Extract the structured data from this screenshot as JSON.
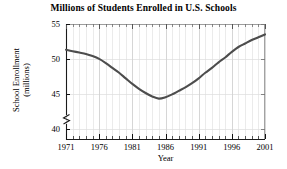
{
  "chart_data": {
    "type": "line",
    "title": "Millions of Students Enrolled in U.S. Schools",
    "xlabel": "Year",
    "ylabel_line1": "School Enrollment",
    "ylabel_line2": "(millions)",
    "xlim": [
      1971,
      2001
    ],
    "ylim": [
      38.5,
      55
    ],
    "axis_break": true,
    "grid": true,
    "legend": "none",
    "x_major_ticks": [
      1971,
      1976,
      1981,
      1986,
      1991,
      1996,
      2001
    ],
    "x_major_tick_labels": [
      "1971",
      "1976",
      "1981",
      "1986",
      "1991",
      "1996",
      "2001"
    ],
    "x_minor_tick_step": 1,
    "y_major_ticks": [
      40,
      45,
      50,
      55
    ],
    "y_major_tick_labels": [
      "40",
      "45",
      "50",
      "55"
    ],
    "series": [
      {
        "name": "School Enrollment",
        "color": "#4d4d4d",
        "x": [
          1971,
          1972,
          1973,
          1974,
          1975,
          1976,
          1977,
          1978,
          1979,
          1980,
          1981,
          1982,
          1983,
          1984,
          1985,
          1986,
          1987,
          1988,
          1989,
          1990,
          1991,
          1992,
          1993,
          1994,
          1995,
          1996,
          1997,
          1998,
          1999,
          2000,
          2001
        ],
        "values": [
          51.3,
          51.1,
          50.9,
          50.7,
          50.4,
          50.0,
          49.4,
          48.7,
          48.0,
          47.2,
          46.4,
          45.7,
          45.1,
          44.6,
          44.3,
          44.5,
          44.9,
          45.4,
          45.9,
          46.5,
          47.2,
          48.0,
          48.7,
          49.5,
          50.2,
          51.0,
          51.7,
          52.2,
          52.7,
          53.1,
          53.5
        ]
      }
    ]
  }
}
